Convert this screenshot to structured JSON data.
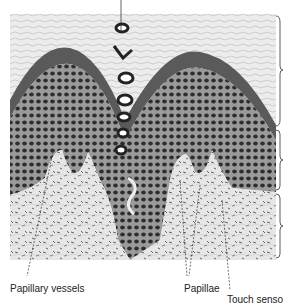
{
  "figure": {
    "labels": [
      {
        "id": "papillary-vessels",
        "text": "Papillary vessels"
      },
      {
        "id": "papillae",
        "text": "Papillae"
      },
      {
        "id": "touch-sensor",
        "text": "Touch sensor"
      }
    ],
    "layers_bracketed": [
      "stratum corneum",
      "epidermis (cellular layer)",
      "dermis"
    ],
    "colors": {
      "background": "#ffffff",
      "corneum": "#d6d6d6",
      "granular_band": "#555555",
      "cellular_bg": "#8a8a8a",
      "cell_dots": "#2a2a2a",
      "dermis": "#e4e4e4",
      "ink": "#222222"
    }
  }
}
